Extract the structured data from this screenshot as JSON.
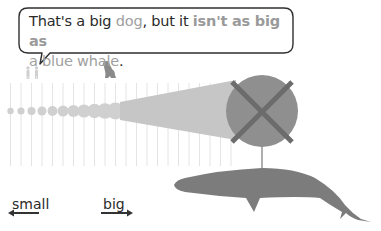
{
  "speech_bubble": {
    "segments": [
      {
        "text": "That's a big ",
        "style": "normal"
      },
      {
        "text": "dog",
        "style": "light"
      },
      {
        "text": ", but it ",
        "style": "normal"
      },
      {
        "text": "isn't as big as",
        "style": "bold"
      },
      {
        "text": "a blue whale",
        "style": "light"
      },
      {
        "text": ".",
        "style": "normal"
      }
    ]
  },
  "figures": {
    "people_icon": "people-icon",
    "dog_icon": "dog-icon",
    "whale_icon": "blue-whale-icon",
    "cross_icon": "x-mark-icon"
  },
  "scale": {
    "small_label": "small",
    "big_label": "big"
  },
  "colors": {
    "dots": "#cfcfcf",
    "cone": "#c4c4c4",
    "big_circle": "#8e8e8e",
    "cross": "#6e6e6e",
    "whale": "#7b7b7b",
    "grid_lines": "#e6e6e6",
    "bubble_border": "#2f2f2f",
    "highlight_text": "#a0a0a0"
  }
}
